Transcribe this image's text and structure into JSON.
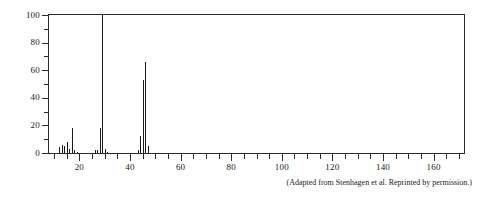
{
  "figure": {
    "caption": "(Adapted from Stenhagen et al. Reprinted by permission.)"
  },
  "chart_data": {
    "type": "bar",
    "title": "",
    "xlabel": "",
    "ylabel": "",
    "xlim": [
      8,
      172
    ],
    "ylim": [
      0,
      100
    ],
    "grid": false,
    "legend": "none",
    "x_major_ticks": [
      20,
      40,
      60,
      80,
      100,
      120,
      140,
      160
    ],
    "x_major_tick_labels": [
      "20",
      "40",
      "60",
      "80",
      "100",
      "120",
      "140",
      "160"
    ],
    "x_minor_tick_interval": 5,
    "y_major_ticks": [
      0,
      20,
      40,
      60,
      80,
      100
    ],
    "y_major_tick_labels": [
      "0",
      "20",
      "40",
      "60",
      "80",
      "100"
    ],
    "y_minor_tick_interval": 10,
    "x": [
      12,
      13,
      14,
      15,
      16,
      17,
      18,
      19,
      26,
      27,
      28,
      29,
      30,
      31,
      43,
      44,
      45,
      46,
      47
    ],
    "values": [
      4,
      6,
      5,
      8,
      3,
      18,
      2,
      1,
      2,
      2,
      18,
      100,
      3,
      1,
      2,
      12,
      53,
      66,
      5
    ],
    "base_peak_mz": 29,
    "base_peak_intensity": 100
  }
}
